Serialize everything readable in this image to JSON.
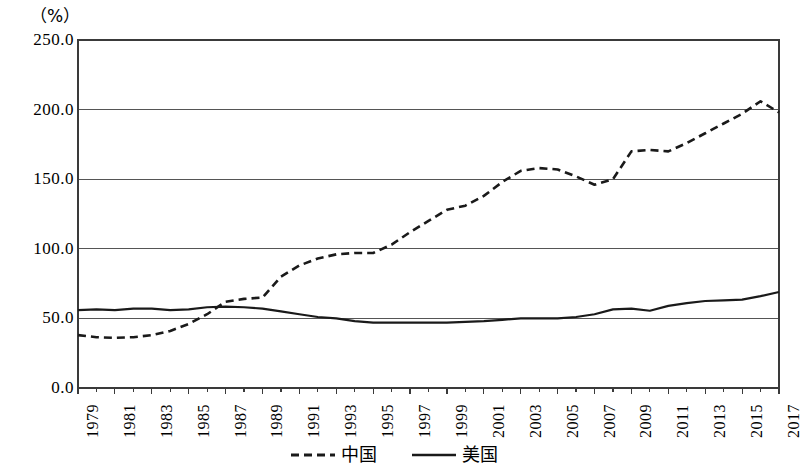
{
  "chart_data": {
    "type": "line",
    "title": "",
    "subtitle": "",
    "unit_label": "（%）",
    "xlabel": "",
    "ylabel": "",
    "ylim": [
      0.0,
      250.0
    ],
    "yticks": [
      "0.0",
      "50.0",
      "100.0",
      "150.0",
      "200.0",
      "250.0"
    ],
    "ytick_values": [
      0.0,
      50.0,
      100.0,
      150.0,
      200.0,
      250.0
    ],
    "grid": true,
    "grid_axis": "y",
    "legend_position": "bottom-center",
    "xlim": [
      1979,
      2017
    ],
    "x": [
      1979,
      1980,
      1981,
      1982,
      1983,
      1984,
      1985,
      1986,
      1987,
      1988,
      1989,
      1990,
      1991,
      1992,
      1993,
      1994,
      1995,
      1996,
      1997,
      1998,
      1999,
      2000,
      2001,
      2002,
      2003,
      2004,
      2005,
      2006,
      2007,
      2008,
      2009,
      2010,
      2011,
      2012,
      2013,
      2014,
      2015,
      2016,
      2017
    ],
    "xtick_labels": [
      "1979",
      "1981",
      "1983",
      "1985",
      "1987",
      "1989",
      "1991",
      "1993",
      "1995",
      "1997",
      "1999",
      "2001",
      "2003",
      "2005",
      "2007",
      "2009",
      "2011",
      "2013",
      "2015",
      "2017"
    ],
    "xtick_values": [
      1979,
      1981,
      1983,
      1985,
      1987,
      1989,
      1991,
      1993,
      1995,
      1997,
      1999,
      2001,
      2003,
      2005,
      2007,
      2009,
      2011,
      2013,
      2015,
      2017
    ],
    "series": [
      {
        "name": "中国",
        "style": "dashed",
        "color": "#1a1a1a",
        "values": [
          38.0,
          36.5,
          36.0,
          36.5,
          38.0,
          41.0,
          46.0,
          53.0,
          62.0,
          64.0,
          65.0,
          80.0,
          88.0,
          93.0,
          96.0,
          97.0,
          97.0,
          103.0,
          112.0,
          120.0,
          128.0,
          131.0,
          138.0,
          148.0,
          156.0,
          158.0,
          157.0,
          152.0,
          146.0,
          150.0,
          170.0,
          171.0,
          170.0,
          176.0,
          183.0,
          190.0,
          197.0,
          206.0,
          198.0
        ]
      },
      {
        "name": "美国",
        "style": "solid",
        "color": "#1a1a1a",
        "values": [
          56.0,
          56.5,
          56.0,
          57.0,
          57.0,
          56.0,
          56.5,
          58.0,
          58.5,
          58.0,
          57.0,
          55.0,
          53.0,
          51.0,
          50.0,
          48.0,
          47.0,
          47.0,
          47.0,
          47.0,
          47.0,
          47.5,
          48.0,
          49.0,
          50.0,
          50.0,
          50.0,
          51.0,
          53.0,
          56.5,
          57.0,
          55.5,
          59.0,
          61.0,
          62.5,
          63.0,
          63.5,
          66.0,
          69.0
        ]
      }
    ]
  },
  "legend": {
    "entries": [
      {
        "label": "中国",
        "style": "dashed"
      },
      {
        "label": "美国",
        "style": "solid"
      }
    ]
  },
  "axes": {
    "plot_left": 78,
    "plot_right": 779,
    "plot_top": 40,
    "plot_bottom": 388
  }
}
